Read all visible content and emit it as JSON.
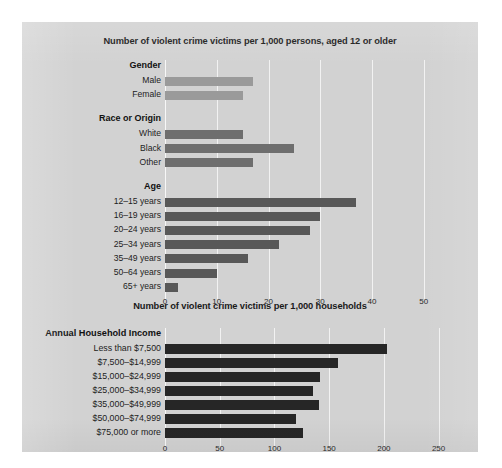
{
  "figure": {
    "background_color": "#d2d2d2",
    "page_color": "#ffffff"
  },
  "chart_data": [
    {
      "id": "victims-per-1000-persons",
      "type": "bar",
      "orientation": "horizontal",
      "title": "Number of violent crime victims per 1,000 persons, aged 12 or older",
      "xlabel": "",
      "ylabel": "",
      "xlim": [
        0,
        57
      ],
      "xticks": [
        0,
        10,
        20,
        30,
        40,
        50
      ],
      "xtick_labels": [
        "0",
        "10",
        "20",
        "30",
        "40",
        "50"
      ],
      "grid": true,
      "legend": "none",
      "groups": [
        {
          "name": "Gender",
          "color": "#9a9a9a",
          "categories": [
            "Male",
            "Female"
          ],
          "values": [
            17,
            15
          ]
        },
        {
          "name": "Race or Origin",
          "color": "#6e6e6e",
          "categories": [
            "White",
            "Black",
            "Other"
          ],
          "values": [
            15,
            25,
            17
          ]
        },
        {
          "name": "Age",
          "color": "#585858",
          "categories": [
            "12–15 years",
            "16–19 years",
            "20–24 years",
            "25–34 years",
            "35–49 years",
            "50–64 years",
            "65+ years"
          ],
          "values": [
            37,
            30,
            28,
            22,
            16,
            10,
            2.5
          ]
        }
      ]
    },
    {
      "id": "victims-per-1000-households",
      "type": "bar",
      "orientation": "horizontal",
      "title": "Number of violent crime victims per 1,000 households",
      "xlabel": "",
      "ylabel": "",
      "xlim": [
        0,
        265
      ],
      "xticks": [
        0,
        50,
        100,
        150,
        200,
        250
      ],
      "xtick_labels": [
        "0",
        "50",
        "100",
        "150",
        "200",
        "250"
      ],
      "grid": true,
      "legend": "none",
      "groups": [
        {
          "name": "Annual Household Income",
          "color": "#262626",
          "categories": [
            "Less than $7,500",
            "$7,500–$14,999",
            "$15,000–$24,999",
            "$25,000–$34,999",
            "$35,000–$49,999",
            "$50,000–$74,999",
            "$75,000 or more"
          ],
          "values": [
            203,
            158,
            142,
            135,
            141,
            120,
            126
          ]
        }
      ]
    }
  ]
}
